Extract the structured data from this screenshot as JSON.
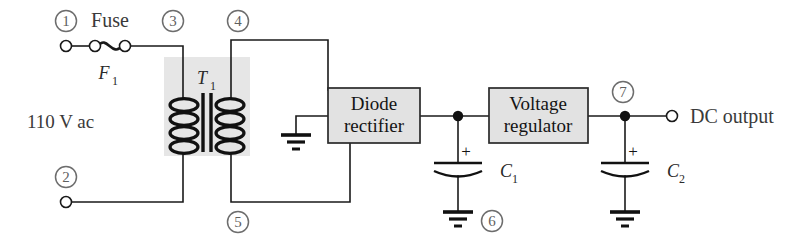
{
  "diagram": {
    "source_label": "110 V ac",
    "output_label": "DC output",
    "fuse_label": "Fuse"
  },
  "nodes": [
    {
      "id": "1",
      "label": "1"
    },
    {
      "id": "2",
      "label": "2"
    },
    {
      "id": "3",
      "label": "3"
    },
    {
      "id": "4",
      "label": "4"
    },
    {
      "id": "5",
      "label": "5"
    },
    {
      "id": "6",
      "label": "6"
    },
    {
      "id": "7",
      "label": "7"
    }
  ],
  "components": {
    "fuse": {
      "name": "Fuse",
      "designator": "F",
      "subscript": "1"
    },
    "transformer": {
      "name": "Transformer",
      "designator": "T",
      "subscript": "1"
    },
    "rectifier": {
      "line1": "Diode",
      "line2": "rectifier"
    },
    "regulator": {
      "line1": "Voltage",
      "line2": "regulator"
    },
    "capacitor_1": {
      "designator": "C",
      "subscript": "1",
      "polarity": "+"
    },
    "capacitor_2": {
      "designator": "C",
      "subscript": "2",
      "polarity": "+"
    }
  },
  "colors": {
    "wire": "#1a1a1a",
    "block_fill": "#e2e2e2",
    "transformer_shade": "#e6e6e6",
    "node_ring": "#6d6d6d",
    "text": "#3a3a3a"
  }
}
